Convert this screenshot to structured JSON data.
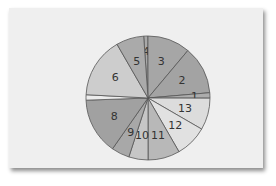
{
  "chart_data": {
    "type": "pie",
    "title": "",
    "start_angle_deg": -4,
    "direction": "clockwise",
    "categories": [
      "4",
      "3",
      "2",
      "1",
      "13",
      "12",
      "11",
      "10",
      "9",
      "8",
      "7",
      "6",
      "5"
    ],
    "values": [
      1.1,
      11.1,
      12.5,
      1.4,
      8.3,
      8.3,
      8.3,
      5.0,
      4.7,
      14.7,
      1.4,
      15.8,
      7.2
    ],
    "colors": [
      "#a9a9a9",
      "#a6a6a6",
      "#a3a3a3",
      "#acacac",
      "#dcdcdc",
      "#e1e1e1",
      "#b8b8b8",
      "#c6c6c6",
      "#a8a8a8",
      "#a1a1a1",
      "#ececec",
      "#cdcdcd",
      "#aaaaaa"
    ],
    "labels_visible": [
      "4",
      "3",
      "2",
      "1",
      "13",
      "12",
      "11",
      "10",
      "9",
      "8",
      "",
      "6",
      "5"
    ],
    "legend": "none"
  },
  "style": {
    "card_bg": "#efefef",
    "stroke": "#555555"
  }
}
